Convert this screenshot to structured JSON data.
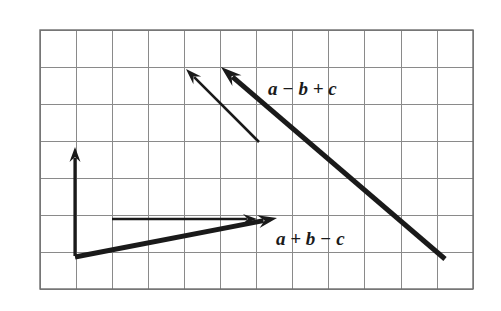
{
  "figure": {
    "type": "vector-diagram",
    "background_color": "#ffffff",
    "grid": {
      "line_color": "#8a8a8a",
      "border_color": "#6e6e6e",
      "line_width": 1,
      "border_width": 1.4,
      "x_start": 40,
      "y_start": 30,
      "cell_width": 36.1,
      "cell_height": 37.0,
      "columns": 12,
      "rows": 7,
      "x_end": 473,
      "y_end": 289
    },
    "labels": [
      {
        "id": "label-a-minus-b-plus-c",
        "text": "a − b + c",
        "x": 268,
        "y": 95,
        "color": "#1a1a1a",
        "font_size": 19,
        "style": "bold-italic-serif"
      },
      {
        "id": "label-a-plus-b-minus-c",
        "text": "a + b − c",
        "x": 276,
        "y": 245,
        "color": "#1a1a1a",
        "font_size": 19,
        "style": "bold-italic-serif"
      }
    ],
    "vectors": [
      {
        "id": "vector-a-vertical",
        "name": "vertical-component-arrow",
        "from": [
          75,
          256
        ],
        "to": [
          75,
          147
        ],
        "stroke_width": 3.2,
        "color": "#1a1a1a",
        "weight": "thin",
        "head_length": 15,
        "head_width": 11
      },
      {
        "id": "vector-b-horizontal",
        "name": "horizontal-component-arrow",
        "from": [
          112,
          219
        ],
        "to": [
          257,
          219
        ],
        "stroke_width": 2.6,
        "color": "#1a1a1a",
        "weight": "thin",
        "head_length": 14,
        "head_width": 10
      },
      {
        "id": "vector-thin-diagonal",
        "name": "thin-diagonal-arrow",
        "from": [
          259,
          142
        ],
        "to": [
          186,
          69
        ],
        "stroke_width": 2.6,
        "color": "#1a1a1a",
        "weight": "thin",
        "head_length": 16,
        "head_width": 11
      },
      {
        "id": "vector-a-plus-b-minus-c",
        "name": "resultant-arrow-a-plus-b-minus-c",
        "from": [
          75,
          257
        ],
        "to": [
          277,
          218
        ],
        "stroke_width": 5.0,
        "color": "#1a1a1a",
        "weight": "thick",
        "head_length": 19,
        "head_width": 13
      },
      {
        "id": "vector-a-minus-b-plus-c",
        "name": "resultant-arrow-a-minus-b-plus-c",
        "from": [
          445,
          259
        ],
        "to": [
          221,
          67
        ],
        "stroke_width": 5.0,
        "color": "#1a1a1a",
        "weight": "thick",
        "head_length": 21,
        "head_width": 14
      }
    ]
  }
}
